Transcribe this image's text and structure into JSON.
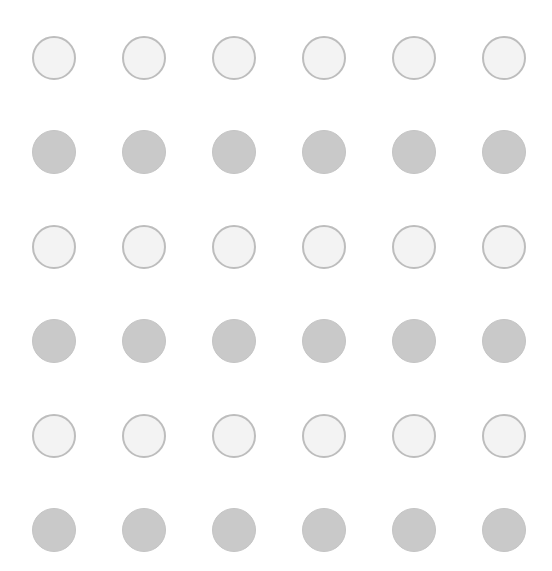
{
  "grid": {
    "rows": 6,
    "columns": 6,
    "column_centers_x": [
      54,
      144,
      234,
      324,
      414,
      504
    ],
    "row_centers_y": [
      58,
      152,
      247,
      341,
      436,
      530
    ],
    "dot_diameter": 44,
    "row_styles": [
      "light",
      "dark",
      "light",
      "dark",
      "light",
      "dark"
    ]
  },
  "colors": {
    "background": "#ffffff",
    "light_fill": "#f3f3f3",
    "light_border": "#bdbdbd",
    "dark_fill": "#c9c9c9"
  }
}
